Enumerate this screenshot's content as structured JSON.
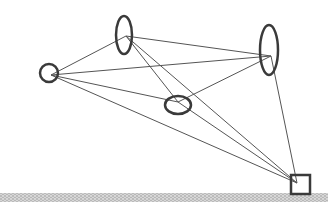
{
  "diagram": {
    "width": 328,
    "height": 206,
    "colors": {
      "background": "#ffffff",
      "node_stroke": "#3a3a3a",
      "edge_stroke": "#555555",
      "ground_fill": "#d8d8d8",
      "ground_dot": "#8a8a8a"
    },
    "nodes": [
      {
        "id": "A",
        "shape": "circle",
        "cx": 49,
        "cy": 73,
        "rx": 9,
        "ry": 9,
        "anchor": [
          51,
          75
        ]
      },
      {
        "id": "B",
        "shape": "ellipse",
        "cx": 124,
        "cy": 35,
        "rx": 8,
        "ry": 19,
        "anchor": [
          126,
          36
        ]
      },
      {
        "id": "C",
        "shape": "ellipse",
        "cx": 269,
        "cy": 50,
        "rx": 9,
        "ry": 25,
        "anchor": [
          271,
          56
        ]
      },
      {
        "id": "D",
        "shape": "ellipse",
        "cx": 178,
        "cy": 105,
        "rx": 13,
        "ry": 9,
        "anchor": [
          178,
          102
        ]
      },
      {
        "id": "E",
        "shape": "square",
        "x": 291,
        "y": 175,
        "w": 19,
        "h": 19,
        "anchor": [
          297,
          183
        ]
      }
    ],
    "edges": [
      [
        "A",
        "B"
      ],
      [
        "A",
        "C"
      ],
      [
        "A",
        "D"
      ],
      [
        "A",
        "E"
      ],
      [
        "B",
        "C"
      ],
      [
        "B",
        "D"
      ],
      [
        "B",
        "E"
      ],
      [
        "D",
        "C"
      ],
      [
        "D",
        "E"
      ],
      [
        "C",
        "E"
      ]
    ],
    "ground": {
      "x": 0,
      "y": 193,
      "w": 328,
      "h": 9
    }
  }
}
